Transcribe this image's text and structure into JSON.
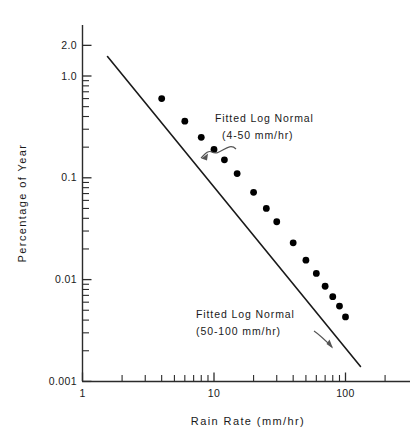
{
  "chart_data": {
    "type": "line",
    "title": "",
    "xlabel": "Rain Rate (mm/hr)",
    "ylabel": "Percentage of Year",
    "xscale": "log",
    "yscale": "log",
    "xlim": [
      1,
      200
    ],
    "ylim": [
      0.001,
      2.0
    ],
    "grid": false,
    "legend_position": "none",
    "x_tick_labels": [
      "1",
      "10",
      "100"
    ],
    "x_tick_values": [
      1,
      10,
      100
    ],
    "y_tick_labels": [
      "2.0",
      "1.0",
      "0.1",
      "0.01",
      "0.001"
    ],
    "y_tick_values": [
      2.0,
      1.0,
      0.1,
      0.01,
      0.001
    ],
    "x_minor_ticks": [
      2,
      3,
      4,
      5,
      6,
      7,
      8,
      9,
      20,
      30,
      40,
      50,
      60,
      70,
      80,
      90,
      200
    ],
    "y_minor_ticks": [
      0.9,
      0.8,
      0.7,
      0.6,
      0.5,
      0.4,
      0.3,
      0.2,
      0.09,
      0.08,
      0.07,
      0.06,
      0.05,
      0.04,
      0.03,
      0.02,
      0.009,
      0.008,
      0.007,
      0.006,
      0.005,
      0.004,
      0.003,
      0.002
    ],
    "series": [
      {
        "name": "Fitted Log Normal",
        "style": "solid-line-with-markers",
        "x": [
          1.55,
          130
        ],
        "y": [
          1.55,
          0.0014
        ],
        "points_x": [
          4,
          6,
          8,
          10,
          12,
          15,
          20,
          25,
          30,
          40,
          50,
          60,
          70,
          80,
          90,
          100
        ],
        "points_y": [
          0.6,
          0.36,
          0.25,
          0.19,
          0.15,
          0.11,
          0.072,
          0.05,
          0.037,
          0.023,
          0.0155,
          0.0115,
          0.0086,
          0.0068,
          0.0055,
          0.0043
        ]
      }
    ],
    "annotations": [
      {
        "name": "fitted-log-normal-4-50",
        "line1": "Fitted Log Normal",
        "line2": "(4-50 mm/hr)",
        "text_x": 215,
        "text_y": 122,
        "arrow_from_x": 236,
        "arrow_from_y": 146,
        "arrow_to_x": 199,
        "arrow_to_y": 160
      },
      {
        "name": "fitted-log-normal-50-100",
        "line1": "Fitted Log Normal",
        "line2": "(50-100 mm/hr)",
        "text_x": 195,
        "text_y": 318,
        "arrow_from_x": 292,
        "arrow_from_y": 340,
        "arrow_to_x": 330,
        "arrow_to_y": 349
      }
    ],
    "colors": {
      "line": "#1a1a1a",
      "marker": "#000000",
      "axis": "#2b2b2b",
      "text": "#1a1a1a",
      "background": "#ffffff"
    }
  },
  "axes": {
    "x_title": "Rain Rate (mm/hr)",
    "y_title": "Percentage of Year"
  }
}
